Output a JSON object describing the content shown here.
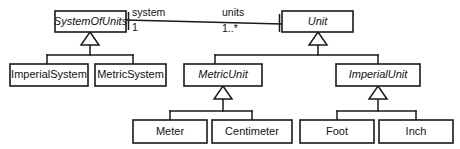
{
  "diagram": {
    "type": "uml-class-diagram",
    "title": "",
    "canvas": {
      "width": 460,
      "height": 149
    },
    "colors": {
      "background": "#ffffff",
      "stroke": "#1a1a1a",
      "box_fill": "#ffffff",
      "text": "#111111"
    },
    "classes": [
      {
        "id": "system-of-units",
        "name": "SystemOfUnits",
        "abstract": true,
        "x": 55,
        "y": 11,
        "w": 71,
        "h": 21
      },
      {
        "id": "unit",
        "name": "Unit",
        "abstract": true,
        "x": 282,
        "y": 11,
        "w": 71,
        "h": 21
      },
      {
        "id": "imperial-system",
        "name": "ImperialSystem",
        "abstract": false,
        "x": 10,
        "y": 64,
        "w": 78,
        "h": 22
      },
      {
        "id": "metric-system",
        "name": "MetricSystem",
        "abstract": false,
        "x": 95,
        "y": 64,
        "w": 71,
        "h": 22
      },
      {
        "id": "metric-unit",
        "name": "MetricUnit",
        "abstract": true,
        "x": 184,
        "y": 64,
        "w": 78,
        "h": 22
      },
      {
        "id": "imperial-unit",
        "name": "ImperialUnit",
        "abstract": true,
        "x": 336,
        "y": 64,
        "w": 84,
        "h": 22
      },
      {
        "id": "meter",
        "name": "Meter",
        "abstract": false,
        "x": 133,
        "y": 120,
        "w": 74,
        "h": 23
      },
      {
        "id": "centimeter",
        "name": "Centimeter",
        "abstract": false,
        "x": 212,
        "y": 120,
        "w": 80,
        "h": 23
      },
      {
        "id": "foot",
        "name": "Foot",
        "abstract": false,
        "x": 300,
        "y": 120,
        "w": 74,
        "h": 23
      },
      {
        "id": "inch",
        "name": "Inch",
        "abstract": false,
        "x": 379,
        "y": 120,
        "w": 74,
        "h": 23
      }
    ],
    "association": {
      "id": "system-units-association",
      "source": "system-of-units",
      "target": "unit",
      "source_role": "system",
      "source_multiplicity": "1",
      "target_role": "units",
      "target_multiplicity": "1..*"
    },
    "generalizations": [
      {
        "id": "gen-system-of-units",
        "parent": "system-of-units",
        "children": [
          "imperial-system",
          "metric-system"
        ]
      },
      {
        "id": "gen-unit",
        "parent": "unit",
        "children": [
          "metric-unit",
          "imperial-unit"
        ]
      },
      {
        "id": "gen-metric-unit",
        "parent": "metric-unit",
        "children": [
          "meter",
          "centimeter"
        ]
      },
      {
        "id": "gen-imperial-unit",
        "parent": "imperial-unit",
        "children": [
          "foot",
          "inch"
        ]
      }
    ]
  }
}
